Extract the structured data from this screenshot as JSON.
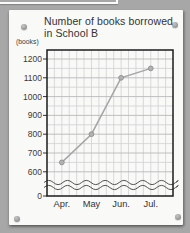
{
  "poster": {
    "title": "Number of books borrowed in School B",
    "y_unit_label": "(books)"
  },
  "chart_data": {
    "type": "line",
    "title": "Number of books borrowed in School B",
    "categories": [
      "Apr.",
      "May",
      "Jun.",
      "Jul."
    ],
    "values": [
      650,
      800,
      1100,
      1150
    ],
    "series": [
      {
        "name": "School B",
        "values": [
          650,
          800,
          1100,
          1150
        ]
      }
    ],
    "xlabel": "",
    "ylabel": "(books)",
    "y_ticks": [
      0,
      600,
      700,
      800,
      900,
      1000,
      1100,
      1200
    ],
    "ylim": [
      0,
      1250
    ],
    "axis_break": true,
    "axis_break_between": [
      0,
      600
    ],
    "grid": true,
    "minor_grid": true,
    "legend": "none",
    "line_color": "#a6a6a6",
    "marker_color": "#b2b2b2",
    "frame_color": "#1b1b1b",
    "grid_color": "#c9c9c9"
  },
  "decor": {
    "board_color": "#a7a7a7",
    "card_color": "#f9f9f8",
    "pin_color": "#9a9a9a"
  }
}
